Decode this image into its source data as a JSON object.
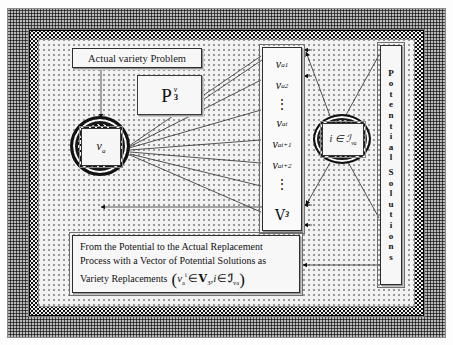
{
  "diagram": {
    "title_label": "Actual variety Problem",
    "potential_operator": {
      "symbol": "P",
      "superscript": "v",
      "superscript_sub": "a",
      "subscript": "З"
    },
    "left_node": {
      "symbol": "v",
      "subscript": "a"
    },
    "right_node": {
      "text": "i ∈ ℐ",
      "subscript": "v",
      "subscript2": "a"
    },
    "vector_column": {
      "items": [
        "v₁",
        "v₂",
        "⋮",
        "vᵢ",
        "vᵢ₊₁",
        "vᵢ₊₂",
        "⋮"
      ],
      "cells": [
        {
          "base": "v",
          "sub": "a",
          "sup": "1"
        },
        {
          "base": "v",
          "sub": "a",
          "sup": "2"
        },
        {
          "dots": "⋮"
        },
        {
          "base": "v",
          "sub": "a",
          "sup": "i"
        },
        {
          "base": "v",
          "sub": "a",
          "sup": "i+1"
        },
        {
          "base": "v",
          "sub": "a",
          "sup": "i+2"
        },
        {
          "dots": "⋮"
        }
      ],
      "tail": {
        "base": "V",
        "sub": "З"
      }
    },
    "potential_solutions_label": "Potential Solutions",
    "potential_solutions_letters": [
      "P",
      "o",
      "t",
      "e",
      "n",
      "t",
      "i",
      "a",
      "l",
      " ",
      "S",
      "o",
      "l",
      "u",
      "t",
      "i",
      "o",
      "n",
      "s"
    ],
    "caption": {
      "line1": "From the Potential to the Actual Replacement",
      "line2": "Process with a Vector of Potential Solutions as",
      "line3": "Variety Replacements",
      "formula": {
        "open": "(",
        "term1_base": "v",
        "term1_sub": "a",
        "term1_sup": "i",
        "in1": "∈",
        "set1": "V",
        "set1_sub": "З",
        "comma": ",",
        "term2": "i",
        "in2": "∈",
        "set2": "ℐ",
        "set2_sub": "v",
        "set2_sub2": "a",
        "close": ")"
      }
    },
    "colors": {
      "ink": "#111111",
      "panel": "#f2f2f2",
      "box": "#f7f7f7",
      "frame": "#2b2b2b"
    }
  }
}
